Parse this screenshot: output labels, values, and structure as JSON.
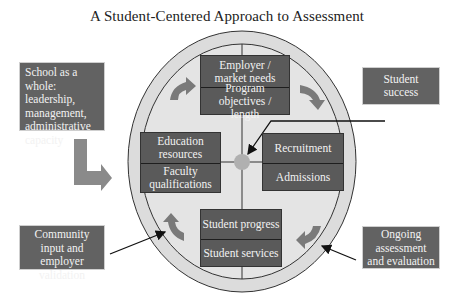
{
  "title": "A Student-Centered Approach to Assessment",
  "center_boxes": {
    "top": [
      "Employer / market needs",
      "Program objectives / length"
    ],
    "left": [
      "Education resources",
      "Faculty qualifications"
    ],
    "right": [
      "Recruitment",
      "Admissions"
    ],
    "bottom": [
      "Student progress",
      "Student services"
    ]
  },
  "external_boxes": {
    "school": "School as a whole: leadership, management, administrative capacity",
    "student_success": "Student success",
    "community": "Community input and employer validation",
    "ongoing": "Ongoing assessment and evaluation"
  },
  "colors": {
    "ring": "#d8d8d8",
    "box": "#5a5a5a",
    "arrow": "#7a7a7a",
    "center_dot": "#b0b0b0"
  }
}
